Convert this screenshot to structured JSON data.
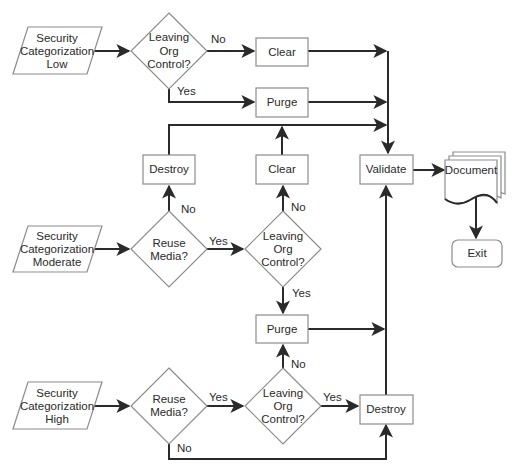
{
  "diagram": {
    "type": "flowchart",
    "inputs": {
      "low": [
        "Security",
        "Categorization",
        "Low"
      ],
      "moderate": [
        "Security",
        "Categorization",
        "Moderate"
      ],
      "high": [
        "Security",
        "Categorization",
        "High"
      ]
    },
    "decisions": {
      "low_leaving": [
        "Leaving",
        "Org",
        "Control?"
      ],
      "mod_reuse": [
        "Reuse",
        "Media?"
      ],
      "mod_leaving": [
        "Leaving",
        "Org",
        "Control?"
      ],
      "high_reuse": [
        "Reuse",
        "Media?"
      ],
      "high_leaving": [
        "Leaving",
        "Org",
        "Control?"
      ]
    },
    "processes": {
      "low_clear": "Clear",
      "low_purge": "Purge",
      "mod_destroy": "Destroy",
      "mod_clear": "Clear",
      "validate": "Validate",
      "mid_purge": "Purge",
      "high_destroy": "Destroy"
    },
    "document": "Document",
    "terminal": "Exit",
    "edge_labels": {
      "low_leaving_no": "No",
      "low_leaving_yes": "Yes",
      "mod_reuse_no": "No",
      "mod_reuse_yes": "Yes",
      "mod_leaving_no": "No",
      "mod_leaving_yes": "Yes",
      "high_reuse_yes": "Yes",
      "high_reuse_no": "No",
      "high_leaving_no": "No",
      "high_leaving_yes": "Yes"
    },
    "edges": [
      [
        "Security Categorization Low",
        "Leaving Org Control? (low)"
      ],
      [
        "Leaving Org Control? (low)",
        "Clear (top)",
        "No"
      ],
      [
        "Leaving Org Control? (low)",
        "Purge (top)",
        "Yes"
      ],
      [
        "Clear (top)",
        "Validate"
      ],
      [
        "Purge (top)",
        "Validate"
      ],
      [
        "Security Categorization Moderate",
        "Reuse Media? (moderate)"
      ],
      [
        "Reuse Media? (moderate)",
        "Destroy (mid)",
        "No"
      ],
      [
        "Reuse Media? (moderate)",
        "Leaving Org Control? (moderate)",
        "Yes"
      ],
      [
        "Leaving Org Control? (moderate)",
        "Clear (mid)",
        "No"
      ],
      [
        "Leaving Org Control? (moderate)",
        "Purge (mid)",
        "Yes"
      ],
      [
        "Destroy (mid)",
        "Validate"
      ],
      [
        "Clear (mid)",
        "Validate"
      ],
      [
        "Purge (mid)",
        "Validate"
      ],
      [
        "Security Categorization High",
        "Reuse Media? (high)"
      ],
      [
        "Reuse Media? (high)",
        "Leaving Org Control? (high)",
        "Yes"
      ],
      [
        "Reuse Media? (high)",
        "Destroy (bottom)",
        "No"
      ],
      [
        "Leaving Org Control? (high)",
        "Purge (mid)",
        "No"
      ],
      [
        "Leaving Org Control? (high)",
        "Destroy (bottom)",
        "Yes"
      ],
      [
        "Destroy (bottom)",
        "Validate"
      ],
      [
        "Validate",
        "Document"
      ],
      [
        "Document",
        "Exit"
      ]
    ]
  }
}
